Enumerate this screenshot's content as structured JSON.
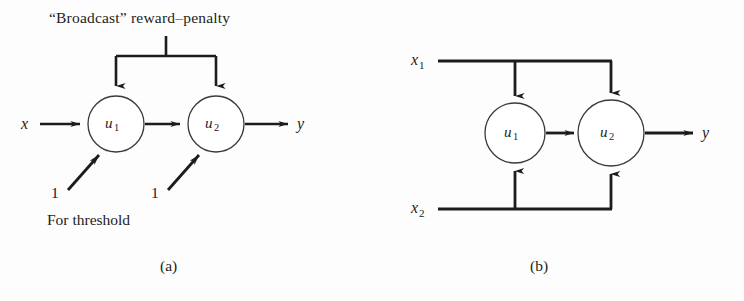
{
  "figure": {
    "background_color": "#fdfdfd",
    "stroke_color": "#1c1c1c",
    "panels": [
      {
        "id": "a",
        "caption": "(a)",
        "title": "“Broadcast” reward–penalty",
        "note": "For threshold",
        "input_label": "x",
        "output_label": "y",
        "bias_labels": [
          "1",
          "1"
        ],
        "nodes": [
          {
            "label": "u",
            "subscript": "1"
          },
          {
            "label": "u",
            "subscript": "2"
          }
        ]
      },
      {
        "id": "b",
        "caption": "(b)",
        "inputs": [
          {
            "label": "x",
            "subscript": "1"
          },
          {
            "label": "x",
            "subscript": "2"
          }
        ],
        "output_label": "y",
        "nodes": [
          {
            "label": "u",
            "subscript": "1"
          },
          {
            "label": "u",
            "subscript": "2"
          }
        ]
      }
    ]
  }
}
